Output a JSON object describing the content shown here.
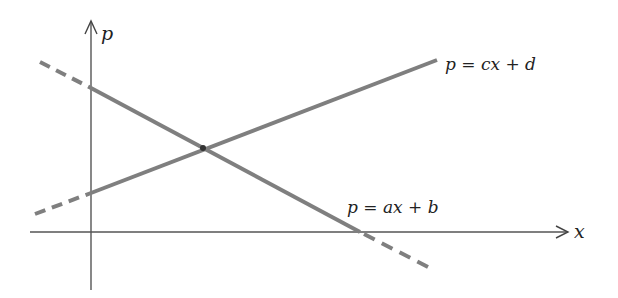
{
  "diagram": {
    "type": "line-graph",
    "axes": {
      "x_label": "x",
      "y_label": "p",
      "axis_color": "#555555"
    },
    "lines": [
      {
        "id": "ax_plus_b",
        "label": "p = ax + b",
        "slope_sign": "negative",
        "color": "#7f7f7f",
        "extensions": "dashed"
      },
      {
        "id": "cx_plus_d",
        "label": "p = cx + d",
        "slope_sign": "positive",
        "color": "#7f7f7f",
        "extensions": "dashed-left"
      }
    ],
    "intersection": {
      "marked": true
    }
  }
}
